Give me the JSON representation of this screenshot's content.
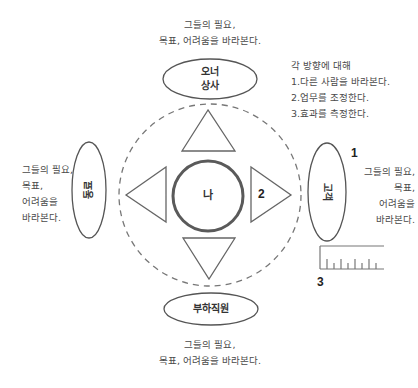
{
  "diagram": {
    "top_note": {
      "line1": "그들의 필요,",
      "line2": "목표, 어려움을 바라본다."
    },
    "bottom_note": {
      "line1": "그들의 필요,",
      "line2": "목표, 어려움을 바라본다."
    },
    "left_note": {
      "line1": "그들의 필요,",
      "line2": "목표,",
      "line3": "어려움을",
      "line4": "바라본다."
    },
    "right_note": {
      "line1": "그들의 필요,",
      "line2": "목표,",
      "line3": "어려움을",
      "line4": "바라본다."
    },
    "directions_note": {
      "title": "각 방향에 대해",
      "items": [
        "1.다른 사람을 바라본다.",
        "2.업무를 조정한다.",
        "3.효과를 측정한다."
      ]
    },
    "nodes": {
      "top": {
        "line1": "오너",
        "line2": "상사"
      },
      "bottom": "부하직원",
      "left": "동료",
      "right": "고객",
      "center": "나"
    },
    "markers": {
      "one": "1",
      "two": "2",
      "three": "3"
    },
    "colors": {
      "stroke": "#555555",
      "dashed": "#666666",
      "center_ring": "#555555",
      "text": "#4a4a4a"
    }
  }
}
